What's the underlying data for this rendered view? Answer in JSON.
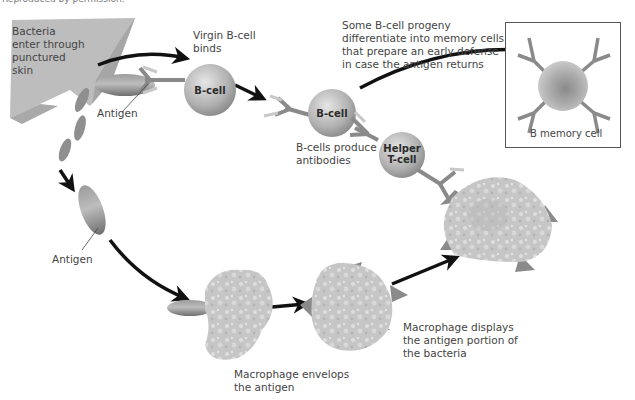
{
  "header": {
    "note": "Reproduced by permission."
  },
  "labels": {
    "bacteria_entry": "Bacteria\nenter through\npunctured\nskin",
    "antigen_top": "Antigen",
    "antigen_left": "Antigen",
    "virgin_bcell": "Virgin B-cell\nbinds",
    "bcells_produce": "B-cells produce\nantibodies",
    "memory_note": "Some B-cell progeny\ndifferentiate into memory cells\nthat prepare an early defense\nin case the antigen returns",
    "memory_cell": "B memory cell",
    "macrophage_envelops": "Macrophage envelops\nthe antigen",
    "macrophage_displays": "Macrophage displays\nthe antigen portion of\nthe bacteria"
  },
  "cells": {
    "virgin_bcell": "B-cell",
    "bcell": "B-cell",
    "helper_tcell": "Helper\nT-cell"
  },
  "colors": {
    "skin": "#b8b8b8",
    "antigen": "#8a8a8a",
    "cell": "#b5b5b5",
    "macrophage": "#c4c4c4",
    "arrow": "#111111",
    "text": "#444444"
  }
}
